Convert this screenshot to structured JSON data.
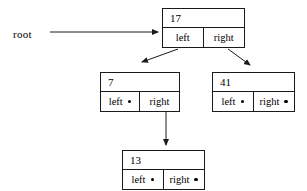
{
  "diagram": {
    "root_label": "root",
    "line_color": "#1a1a1a",
    "background_color": "#ffffff",
    "nodes": [
      {
        "id": "root",
        "value": "17",
        "left_label": "left",
        "right_label": "right",
        "left_has_dot": false,
        "right_has_dot": false
      },
      {
        "id": "n7",
        "value": "7",
        "left_label": "left",
        "right_label": "right",
        "left_has_dot": true,
        "right_has_dot": false
      },
      {
        "id": "n41",
        "value": "41",
        "left_label": "left",
        "right_label": "right",
        "left_has_dot": true,
        "right_has_dot": true
      },
      {
        "id": "n13",
        "value": "13",
        "left_label": "left",
        "right_label": "right",
        "left_has_dot": true,
        "right_has_dot": true
      }
    ],
    "edges": [
      {
        "name": "root-pointer-arrow",
        "from": "root-label",
        "to": "node-17"
      },
      {
        "name": "node17-left-arrow",
        "from": "node-17-left",
        "to": "node-7"
      },
      {
        "name": "node17-right-arrow",
        "from": "node-17-right",
        "to": "node-41"
      },
      {
        "name": "node7-right-arrow",
        "from": "node-7-right",
        "to": "node-13"
      }
    ]
  }
}
